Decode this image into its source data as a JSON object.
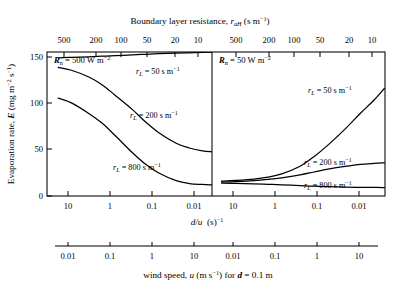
{
  "chart_data": {
    "type": "line",
    "title_parts": {
      "main": "Boundary layer resistance, ",
      "symbol": "r",
      "symbol_sub": "aH",
      "units": " (s m",
      "units_sup": "−1",
      "units_end": ")"
    },
    "ylabel_parts": {
      "main": "Evaporation rate, ",
      "symbol": "E",
      "units": " (mg m",
      "units_sup1": "−2",
      "units_mid": " s",
      "units_sup2": "−1",
      "units_end": ")"
    },
    "xlabel_primary_parts": {
      "symbol": "d/u",
      "units": "  (s)",
      "units_sup": "−1"
    },
    "xlabel_secondary_parts": {
      "main": "wind speed, ",
      "symbol": "u",
      "units": " (m s",
      "units_sup": "−1",
      "mid": ") for ",
      "symbol2": "d",
      "end": " = 0.1 m"
    },
    "top_axis_ticks": [
      "500",
      "200",
      "100",
      "50",
      "20",
      "10"
    ],
    "bottom_axis_ticks": [
      "10",
      "1",
      "0.1",
      "0.01"
    ],
    "wind_axis_ticks": [
      "0.01",
      "0.1",
      "1",
      "10"
    ],
    "ylim": [
      0,
      150
    ],
    "yticks": [
      0,
      50,
      100,
      150
    ],
    "ytick_labels": [
      "0",
      "50",
      "100",
      "150"
    ],
    "grid": false,
    "legend_position": "inline-annotations",
    "panels": [
      {
        "id": "left",
        "label_parts": {
          "symbol": "R",
          "symbol_sub": "n",
          "value": " = 500 W m",
          "value_sup": "−2"
        },
        "Rn_W_m2": 500,
        "series": [
          {
            "name": "r_L = 50 s m^-1",
            "label_parts": {
              "symbol": "r",
              "symbol_sub": "L",
              "value": " = 50 s m",
              "value_sup": "−1"
            },
            "rL": 50,
            "x_dOverU": [
              10,
              5,
              2,
              1,
              0.5,
              0.2,
              0.1,
              0.05,
              0.02,
              0.01,
              0.005,
              0.003
            ],
            "y_E": [
              144,
              144.4,
              145,
              145.6,
              146.2,
              147,
              147.6,
              148.2,
              148.8,
              149.2,
              149.6,
              150
            ]
          },
          {
            "name": "r_L = 200 s m^-1",
            "label_parts": {
              "symbol": "r",
              "symbol_sub": "L",
              "value": " = 200 s m",
              "value_sup": "−1"
            },
            "rL": 200,
            "x_dOverU": [
              10,
              5,
              2,
              1,
              0.5,
              0.2,
              0.1,
              0.05,
              0.02,
              0.01,
              0.005,
              0.003
            ],
            "y_E": [
              134,
              131,
              124,
              116,
              105,
              90,
              77,
              66,
              55,
              50,
              47,
              46
            ]
          },
          {
            "name": "r_L = 800 s m^-1",
            "label_parts": {
              "symbol": "r",
              "symbol_sub": "L",
              "value": " = 800 s m",
              "value_sup": "−1"
            },
            "rL": 800,
            "x_dOverU": [
              10,
              5,
              2,
              1,
              0.5,
              0.2,
              0.1,
              0.05,
              0.02,
              0.01,
              0.005,
              0.003
            ],
            "y_E": [
              102,
              97,
              86,
              76,
              63,
              45,
              33,
              24,
              16,
              13,
              12,
              11.5
            ]
          }
        ]
      },
      {
        "id": "right",
        "label_parts": {
          "symbol": "R",
          "symbol_sub": "n",
          "value": " = 50 W m",
          "value_sup": "−2"
        },
        "Rn_W_m2": 50,
        "series": [
          {
            "name": "r_L = 50 s m^-1",
            "label_parts": {
              "symbol": "r",
              "symbol_sub": "L",
              "value": " = 50 s m",
              "value_sup": "−1"
            },
            "rL": 50,
            "x_dOverU": [
              10,
              5,
              2,
              1,
              0.5,
              0.2,
              0.1,
              0.05,
              0.02,
              0.01,
              0.005,
              0.003
            ],
            "y_E": [
              15.5,
              16.2,
              17.6,
              19.6,
              23,
              31,
              41,
              53,
              71,
              86,
              100,
              112
            ]
          },
          {
            "name": "r_L = 200 s m^-1",
            "label_parts": {
              "symbol": "r",
              "symbol_sub": "L",
              "value": " = 200 s m",
              "value_sup": "−1"
            },
            "rL": 200,
            "x_dOverU": [
              10,
              5,
              2,
              1,
              0.5,
              0.2,
              0.1,
              0.05,
              0.02,
              0.01,
              0.005,
              0.003
            ],
            "y_E": [
              14.5,
              15,
              16,
              17.3,
              19,
              22,
              25,
              28,
              31,
              33,
              34,
              34.5
            ]
          },
          {
            "name": "r_L = 800 s m^-1",
            "label_parts": {
              "symbol": "r",
              "symbol_sub": "L",
              "value": " = 800 s m",
              "value_sup": "−1"
            },
            "rL": 800,
            "x_dOverU": [
              10,
              5,
              2,
              1,
              0.5,
              0.2,
              0.1,
              0.05,
              0.02,
              0.01,
              0.005,
              0.003
            ],
            "y_E": [
              13.5,
              13.2,
              12.7,
              12.2,
              11.6,
              10.8,
              10.2,
              9.7,
              9.2,
              9,
              8.9,
              8.8
            ]
          }
        ]
      }
    ]
  }
}
